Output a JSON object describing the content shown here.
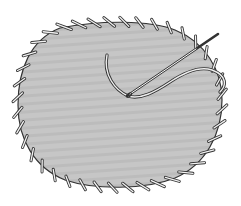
{
  "illustration": {
    "subject": "Whipstitch (overcast stitch) around the edge of a fabric patch",
    "elements": [
      "fabric-patch",
      "whipstitch-border",
      "needle",
      "thread"
    ],
    "colors": {
      "background": "#ffffff",
      "fabric": "#c4c4c4",
      "fabric_stripe": "#b8b8b8",
      "outline": "#333333",
      "thread_fill": "#f2f2f2",
      "needle": "#444444"
    },
    "stitch_count_approx": 40
  }
}
